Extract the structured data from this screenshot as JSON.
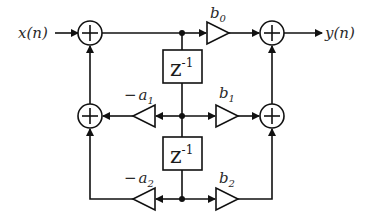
{
  "diagram": {
    "type": "signal-flow",
    "title": "",
    "input_label": "x(n)",
    "output_label": "y(n)",
    "delays": [
      {
        "id": "delay-1",
        "label_base": "z",
        "label_exp": "-1"
      },
      {
        "id": "delay-2",
        "label_base": "z",
        "label_exp": "-1"
      }
    ],
    "gains": [
      {
        "id": "b0",
        "base": "b",
        "sub": "0",
        "sign": ""
      },
      {
        "id": "a1",
        "base": "a",
        "sub": "1",
        "sign": "−"
      },
      {
        "id": "b1",
        "base": "b",
        "sub": "1",
        "sign": ""
      },
      {
        "id": "a2",
        "base": "a",
        "sub": "2",
        "sign": "−"
      },
      {
        "id": "b2",
        "base": "b",
        "sub": "2",
        "sign": ""
      }
    ],
    "adders": [
      {
        "id": "adder-left-top",
        "symbol": "+"
      },
      {
        "id": "adder-left-mid",
        "symbol": "+"
      },
      {
        "id": "adder-right-top",
        "symbol": "+"
      },
      {
        "id": "adder-right-mid",
        "symbol": "+"
      }
    ]
  }
}
